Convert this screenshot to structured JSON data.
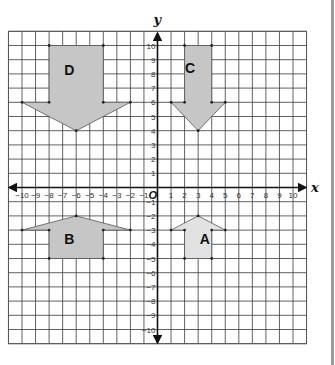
{
  "chart_data": {
    "type": "coordinate-grid",
    "title": "",
    "xlabel": "x",
    "ylabel": "y",
    "origin_label": "O",
    "xlim": [
      -11,
      11
    ],
    "ylim": [
      -11,
      11
    ],
    "grid": true,
    "x_ticks": [
      -10,
      -9,
      -8,
      -7,
      -6,
      -5,
      -4,
      -3,
      -2,
      -1,
      1,
      2,
      3,
      4,
      5,
      6,
      7,
      8,
      9,
      10
    ],
    "y_ticks": [
      -10,
      -9,
      -8,
      -7,
      -6,
      -5,
      -4,
      -3,
      -2,
      -1,
      1,
      2,
      3,
      4,
      5,
      6,
      7,
      8,
      9,
      10
    ],
    "shapes": [
      {
        "name": "D",
        "fill": "#c6c6c6",
        "points": [
          [
            -8,
            10
          ],
          [
            -4,
            10
          ],
          [
            -4,
            6
          ],
          [
            -2,
            6
          ],
          [
            -6,
            4
          ],
          [
            -10,
            6
          ],
          [
            -8,
            6
          ]
        ],
        "vertices": [
          [
            -8,
            10
          ],
          [
            -4,
            10
          ],
          [
            -10,
            6
          ],
          [
            -8,
            6
          ],
          [
            -4,
            6
          ],
          [
            -2,
            6
          ],
          [
            -6,
            4
          ]
        ],
        "label_pos": [
          -6.5,
          8.3
        ]
      },
      {
        "name": "C",
        "fill": "#c6c6c6",
        "points": [
          [
            2,
            10
          ],
          [
            4,
            10
          ],
          [
            4,
            6
          ],
          [
            5,
            6
          ],
          [
            3,
            4
          ],
          [
            1,
            6
          ],
          [
            2,
            6
          ]
        ],
        "vertices": [
          [
            2,
            10
          ],
          [
            4,
            10
          ],
          [
            1,
            6
          ],
          [
            2,
            6
          ],
          [
            4,
            6
          ],
          [
            5,
            6
          ],
          [
            3,
            4
          ]
        ],
        "label_pos": [
          2.4,
          8.4
        ]
      },
      {
        "name": "B",
        "fill": "#c6c6c6",
        "points": [
          [
            -8,
            -5
          ],
          [
            -4,
            -5
          ],
          [
            -4,
            -3
          ],
          [
            -2,
            -3
          ],
          [
            -6,
            -2
          ],
          [
            -10,
            -3
          ],
          [
            -8,
            -3
          ]
        ],
        "vertices": [
          [
            -10,
            -3
          ],
          [
            -8,
            -3
          ],
          [
            -4,
            -3
          ],
          [
            -2,
            -3
          ],
          [
            -6,
            -2
          ],
          [
            -8,
            -5
          ],
          [
            -4,
            -5
          ]
        ],
        "label_pos": [
          -6.5,
          -3.6
        ]
      },
      {
        "name": "A",
        "fill": "#e2e2e2",
        "points": [
          [
            2,
            -5
          ],
          [
            4,
            -5
          ],
          [
            4,
            -3
          ],
          [
            5,
            -3
          ],
          [
            3,
            -2
          ],
          [
            1,
            -3
          ],
          [
            2,
            -3
          ]
        ],
        "vertices": [
          [
            1,
            -3
          ],
          [
            2,
            -3
          ],
          [
            4,
            -3
          ],
          [
            5,
            -3
          ],
          [
            3,
            -2
          ],
          [
            2,
            -5
          ],
          [
            4,
            -5
          ]
        ],
        "label_pos": [
          3.5,
          -3.6
        ]
      }
    ]
  }
}
